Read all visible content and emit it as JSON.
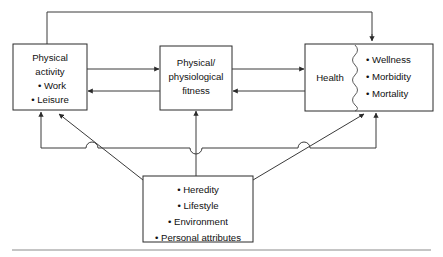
{
  "figure": {
    "type": "flow-diagram",
    "background_color": "#ffffff",
    "line_color": "#3a3a3a",
    "box_border_color": "#2b2b2b",
    "text_color": "#111111"
  },
  "nodes": {
    "physical_activity": {
      "id": "physical-activity",
      "lines": [
        "Physical",
        "activity",
        "• Work",
        "• Leisure"
      ]
    },
    "fitness": {
      "id": "physical-physiological-fitness",
      "lines": [
        "Physical/",
        "physiological",
        "fitness"
      ]
    },
    "health": {
      "id": "health",
      "label": "Health",
      "outcomes": [
        "• Wellness",
        "• Morbidity",
        "• Mortality"
      ]
    },
    "other_factors": {
      "id": "other-factors",
      "lines": [
        "• Heredity",
        "• Lifestyle",
        "• Environment",
        "• Personal attributes"
      ]
    }
  },
  "edges": [
    {
      "id": "activity-to-fitness",
      "from": "physical_activity",
      "to": "fitness",
      "direction": "right"
    },
    {
      "id": "fitness-to-activity",
      "from": "fitness",
      "to": "physical_activity",
      "direction": "left"
    },
    {
      "id": "fitness-to-health",
      "from": "fitness",
      "to": "health",
      "direction": "right"
    },
    {
      "id": "health-to-fitness",
      "from": "health",
      "to": "fitness",
      "direction": "left"
    },
    {
      "id": "activity-to-health-feedback",
      "from": "physical_activity",
      "to": "health",
      "direction": "top-loop"
    },
    {
      "id": "factors-to-activity",
      "from": "other_factors",
      "to": "physical_activity",
      "direction": "up-diagonal"
    },
    {
      "id": "factors-to-fitness",
      "from": "other_factors",
      "to": "fitness",
      "direction": "up-vertical"
    },
    {
      "id": "factors-to-health",
      "from": "other_factors",
      "to": "health",
      "direction": "up-diagonal"
    },
    {
      "id": "bus-to-activity",
      "from": "bus",
      "to": "physical_activity",
      "direction": "up-vertical"
    },
    {
      "id": "bus-to-health",
      "from": "bus",
      "to": "health",
      "direction": "up-vertical"
    }
  ]
}
